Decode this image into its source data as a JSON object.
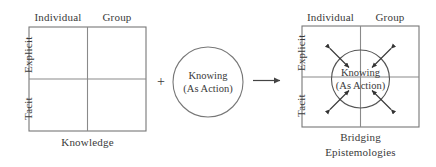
{
  "figure": {
    "title_alt": "Bridging Epistemologies diagram",
    "stroke_color": "#555555",
    "text_color": "#3a3a3a",
    "background_color": "#ffffff"
  },
  "left_matrix": {
    "name": "knowledge-matrix",
    "column_labels": [
      "Individual",
      "Group"
    ],
    "row_labels": [
      "Explicit",
      "Tacit"
    ],
    "caption": "Knowledge",
    "cells": [
      "",
      "",
      "",
      ""
    ]
  },
  "operator": {
    "plus": "+",
    "arrow": "→"
  },
  "knowing_circle": {
    "name": "knowing-circle",
    "line1": "Knowing",
    "line2": "(As Action)"
  },
  "right_matrix": {
    "name": "bridging-matrix",
    "column_labels": [
      "Individual",
      "Group"
    ],
    "row_labels": [
      "Explicit",
      "Tacit"
    ],
    "caption_line1": "Bridging",
    "caption_line2": "Epistemologies",
    "circle": {
      "line1": "Knowing",
      "line2": "(As Action)"
    },
    "arrows": [
      {
        "position": "top-left",
        "type": "double-headed",
        "angle_deg": 225
      },
      {
        "position": "top-right",
        "type": "double-headed",
        "angle_deg": 315
      },
      {
        "position": "bottom-left",
        "type": "double-headed",
        "angle_deg": 135
      },
      {
        "position": "bottom-right",
        "type": "double-headed",
        "angle_deg": 45
      }
    ]
  }
}
